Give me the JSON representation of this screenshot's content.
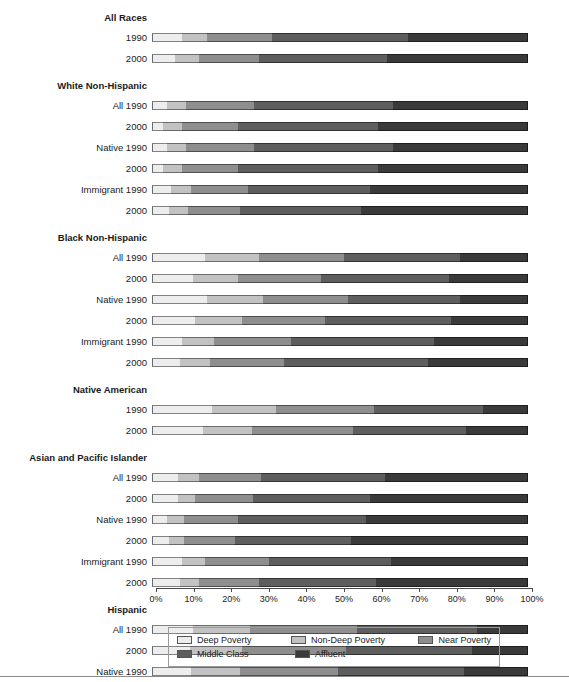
{
  "axis": {
    "ticks": [
      "0%",
      "10%",
      "20%",
      "30%",
      "40%",
      "50%",
      "60%",
      "70%",
      "80%",
      "90%",
      "100%"
    ],
    "min": 0,
    "max": 100
  },
  "legend": {
    "items": [
      {
        "label": "Deep Poverty",
        "color": "#ededed"
      },
      {
        "label": "Non-Deep Poverty",
        "color": "#c2c2c2"
      },
      {
        "label": "Near Poverty",
        "color": "#8e8e8e"
      },
      {
        "label": "Middle Class",
        "color": "#5e5e5e"
      },
      {
        "label": "Affluent",
        "color": "#3a3a3a"
      }
    ]
  },
  "chart_data": {
    "type": "bar",
    "orientation": "horizontal",
    "stacked": true,
    "normalized": true,
    "title": "",
    "xlabel": "",
    "ylabel": "",
    "xlim": [
      0,
      100
    ],
    "grid": false,
    "legend_position": "bottom",
    "series": [
      {
        "name": "Deep Poverty",
        "color": "#ededed"
      },
      {
        "name": "Non-Deep Poverty",
        "color": "#c2c2c2"
      },
      {
        "name": "Near Poverty",
        "color": "#8e8e8e"
      },
      {
        "name": "Middle Class",
        "color": "#5e5e5e"
      },
      {
        "name": "Affluent",
        "color": "#3a3a3a"
      }
    ],
    "groups": [
      {
        "name": "All Races",
        "rows": [
          {
            "label": "1990",
            "values": [
              8.0,
              6.5,
              17.5,
              36.0,
              32.0
            ]
          },
          {
            "label": "2000",
            "values": [
              6.0,
              6.5,
              16.0,
              34.0,
              37.5
            ]
          }
        ]
      },
      {
        "name": "White Non-Hispanic",
        "rows": [
          {
            "label": "All 1990",
            "values": [
              4.0,
              5.0,
              18.0,
              37.0,
              36.0
            ]
          },
          {
            "label": "2000",
            "values": [
              3.0,
              5.0,
              15.0,
              37.0,
              40.0
            ]
          },
          {
            "label": "Native 1990",
            "values": [
              4.0,
              5.0,
              18.0,
              37.0,
              36.0
            ]
          },
          {
            "label": "2000",
            "values": [
              3.0,
              5.0,
              15.0,
              37.0,
              40.0
            ]
          },
          {
            "label": "Immigrant 1990",
            "values": [
              5.0,
              5.5,
              15.0,
              32.5,
              42.0
            ]
          },
          {
            "label": "2000",
            "values": [
              4.5,
              5.0,
              14.0,
              32.0,
              44.5
            ]
          }
        ]
      },
      {
        "name": "Black Non-Hispanic",
        "rows": [
          {
            "label": "All 1990",
            "values": [
              14.0,
              14.5,
              22.5,
              31.0,
              18.0
            ]
          },
          {
            "label": "2000",
            "values": [
              11.0,
              12.0,
              22.0,
              34.0,
              21.0
            ]
          },
          {
            "label": "Native 1990",
            "values": [
              14.5,
              15.0,
              22.5,
              30.0,
              18.0
            ]
          },
          {
            "label": "2000",
            "values": [
              11.5,
              12.5,
              22.0,
              33.5,
              20.5
            ]
          },
          {
            "label": "Immigrant 1990",
            "values": [
              8.0,
              8.5,
              20.5,
              38.0,
              25.0
            ]
          },
          {
            "label": "2000",
            "values": [
              7.5,
              8.0,
              19.5,
              38.5,
              26.5
            ]
          }
        ]
      },
      {
        "name": "Native American",
        "rows": [
          {
            "label": "1990",
            "values": [
              16.0,
              17.0,
              26.0,
              29.0,
              12.0
            ]
          },
          {
            "label": "2000",
            "values": [
              13.5,
              13.0,
              27.0,
              30.0,
              16.5
            ]
          }
        ]
      },
      {
        "name": "Asian and Pacific Islander",
        "rows": [
          {
            "label": "All 1990",
            "values": [
              7.0,
              5.5,
              16.5,
              33.0,
              38.0
            ]
          },
          {
            "label": "2000",
            "values": [
              7.0,
              4.5,
              15.5,
              31.0,
              42.0
            ]
          },
          {
            "label": "Native 1990",
            "values": [
              4.0,
              4.5,
              14.5,
              34.0,
              43.0
            ]
          },
          {
            "label": "2000",
            "values": [
              4.5,
              4.0,
              13.5,
              31.0,
              47.0
            ]
          },
          {
            "label": "Immigrant 1990",
            "values": [
              8.0,
              6.0,
              17.0,
              32.5,
              36.5
            ]
          },
          {
            "label": "2000",
            "values": [
              7.5,
              5.0,
              16.0,
              31.0,
              40.5
            ]
          }
        ]
      },
      {
        "name": "Hispanic",
        "rows": [
          {
            "label": "All 1990",
            "values": [
              11.0,
              15.0,
              28.5,
              32.0,
              13.5
            ]
          },
          {
            "label": "2000",
            "values": [
              10.0,
              14.0,
              27.5,
              33.5,
              15.0
            ]
          },
          {
            "label": "Native 1990",
            "values": [
              10.5,
              13.0,
              26.0,
              33.5,
              17.0
            ]
          },
          {
            "label": "2000",
            "values": [
              8.5,
              11.5,
              24.5,
              35.0,
              20.5
            ]
          },
          {
            "label": "Immigrant 1990",
            "values": [
              11.5,
              16.5,
              31.0,
              31.0,
              10.0
            ]
          },
          {
            "label": "2000",
            "values": [
              10.5,
              16.0,
              30.5,
              32.0,
              11.0
            ]
          }
        ]
      }
    ]
  }
}
